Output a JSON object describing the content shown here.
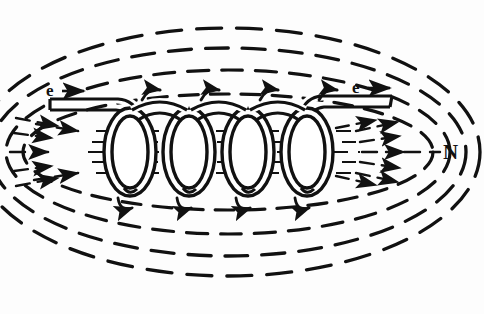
{
  "figure": {
    "type": "physics-diagram",
    "background_color": "#fdfdfd",
    "ink_color": "#111111",
    "width": 484,
    "height": 314
  },
  "labels": {
    "electron_left": "e",
    "electron_right": "e",
    "north_pole": "N"
  },
  "icons": {
    "current_arrow_left": "arrow-right-icon",
    "current_arrow_right": "arrow-right-icon",
    "field_arrow": "arrow-right-icon",
    "coil_current_arrow": "curved-arrow-icon"
  },
  "diagram_data": {
    "type": "diagram",
    "subject": "solenoid",
    "coil_turns": 4,
    "coil_turn_centers_x": [
      130,
      189,
      248,
      307
    ],
    "coil_axis_y": 152,
    "coil_loop_rx": 26,
    "coil_loop_ry": 44,
    "wire_style": "double-line tube",
    "lead_left": {
      "from_x": 50,
      "to_x": 130,
      "y": 104,
      "current_label": "e",
      "current_direction": "right"
    },
    "lead_right": {
      "from_x": 307,
      "to_x": 392,
      "y": 100,
      "current_label": "e",
      "current_direction": "right"
    },
    "interior_field_lines": {
      "count": 5,
      "y_values": [
        131,
        142,
        152,
        162,
        173
      ],
      "style": "dashed",
      "direction": "left-to-right"
    },
    "converging_arrows_left": {
      "count": 5,
      "tip_x": 96,
      "direction": "right"
    },
    "diverging_arrows_right": {
      "count": 5,
      "tail_x": 352,
      "direction": "right"
    },
    "outer_field_loops": {
      "count": 4,
      "style": "dashed",
      "shape": "ellipse",
      "center_x": 228,
      "center_y": 152,
      "radii": [
        {
          "rx": 205,
          "ry": 58
        },
        {
          "rx": 222,
          "ry": 82
        },
        {
          "rx": 238,
          "ry": 104
        },
        {
          "rx": 252,
          "ry": 124
        }
      ]
    },
    "coil_current_arrows": {
      "top_count": 4,
      "bottom_count": 4,
      "rotation_sense": "clockwise viewed from left"
    },
    "pole_markers": [
      {
        "label": "N",
        "x": 445,
        "y": 152,
        "side": "right"
      }
    ]
  }
}
